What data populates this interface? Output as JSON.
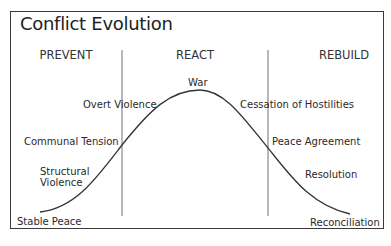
{
  "title": "Conflict Evolution",
  "phases": [
    {
      "label": "PREVENT"
    },
    {
      "label": "REACT"
    },
    {
      "label": "REBUILD"
    }
  ],
  "stages_rising": [
    {
      "label": "Stable Peace"
    },
    {
      "label": "Structural Violence"
    },
    {
      "label": "Communal Tension"
    },
    {
      "label": "Overt Violence"
    }
  ],
  "peak": {
    "label": "War"
  },
  "stages_falling": [
    {
      "label": "Cessation of Hostilities"
    },
    {
      "label": "Peace Agreement"
    },
    {
      "label": "Resolution"
    },
    {
      "label": "Reconciliation"
    }
  ],
  "colors": {
    "line": "#333333",
    "divider": "#777777",
    "frame": "#3a3a3a"
  }
}
